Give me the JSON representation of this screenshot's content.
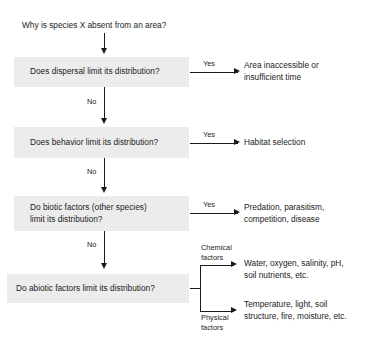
{
  "diagram": {
    "title_question": "Why is species X absent from an area?",
    "nodes": [
      {
        "id": "dispersal",
        "label": "Does dispersal limit its distribution?",
        "yes_label": "Yes",
        "yes_outcome": "Area inaccessible or\ninsufficient time",
        "no_label": "No"
      },
      {
        "id": "behavior",
        "label": "Does behavior limit its distribution?",
        "yes_label": "Yes",
        "yes_outcome": "Habitat selection",
        "no_label": "No"
      },
      {
        "id": "biotic",
        "label": "Do biotic factors (other species)\nlimit its distribution?",
        "yes_label": "Yes",
        "yes_outcome": "Predation, parasitism,\ncompetition, disease",
        "no_label": "No"
      },
      {
        "id": "abiotic",
        "label": "Do abiotic factors limit its distribution?",
        "branch_one_label": "Chemical\nfactors",
        "branch_one_outcome": "Water, oxygen, salinity, pH,\nsoil nutrients, etc.",
        "branch_two_label": "Physical\nfactors",
        "branch_two_outcome": "Temperature, light, soil\nstructure, fire, moisture, etc."
      }
    ],
    "colors": {
      "box_fill": "#ececec",
      "line": "#1b1b1b",
      "text": "#1b1b1b",
      "background": "#ffffff"
    }
  }
}
